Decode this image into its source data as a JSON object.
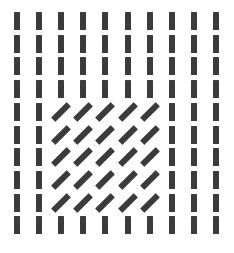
{
  "figure": {
    "grid": {
      "rows": 10,
      "cols": 10,
      "origin_x": 17,
      "origin_y": 21,
      "spacing_x": 22.1,
      "spacing_y": 22.7
    },
    "background_element": {
      "orientation": "vertical",
      "angle_deg": 0
    },
    "target_region": {
      "orientation": "diagonal",
      "angle_deg": 45,
      "row_start": 4,
      "row_end": 8,
      "col_start": 2,
      "col_end": 6
    },
    "colors": {
      "bar": "#3b3b3b",
      "background": "#ffffff"
    }
  }
}
